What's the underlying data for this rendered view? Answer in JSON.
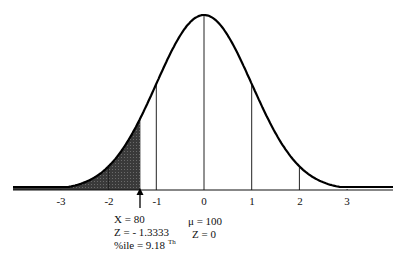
{
  "chart_data": {
    "type": "area",
    "title": "",
    "xlabel": "",
    "ylabel": "",
    "x_ticks": [
      "-3",
      "-2",
      "-1",
      "0",
      "1",
      "2",
      "3"
    ],
    "x_tick_values": [
      -3,
      -2,
      -1,
      0,
      1,
      2,
      3
    ],
    "xlim": [
      -4,
      4
    ],
    "shaded_region": {
      "from_z": -4,
      "to_z": -1.3333,
      "color": "#3a3a3a"
    },
    "marker": {
      "z": -1.3333,
      "type": "arrow-up"
    },
    "grid": false,
    "legend": null
  },
  "axis": {
    "ticks": [
      "-3",
      "-2",
      "-1",
      "0",
      "1",
      "2",
      "3"
    ]
  },
  "annotation_left": {
    "line1": "X = 80",
    "line2": "Z = - 1.3333",
    "line3_prefix": "%ile = 9.18 ",
    "line3_sup": "Th"
  },
  "annotation_mean": {
    "line1": "μ  = 100",
    "line2": "Z = 0"
  },
  "colors": {
    "curve": "#000000",
    "shade": "#3a3a3a",
    "background": "#ffffff"
  }
}
